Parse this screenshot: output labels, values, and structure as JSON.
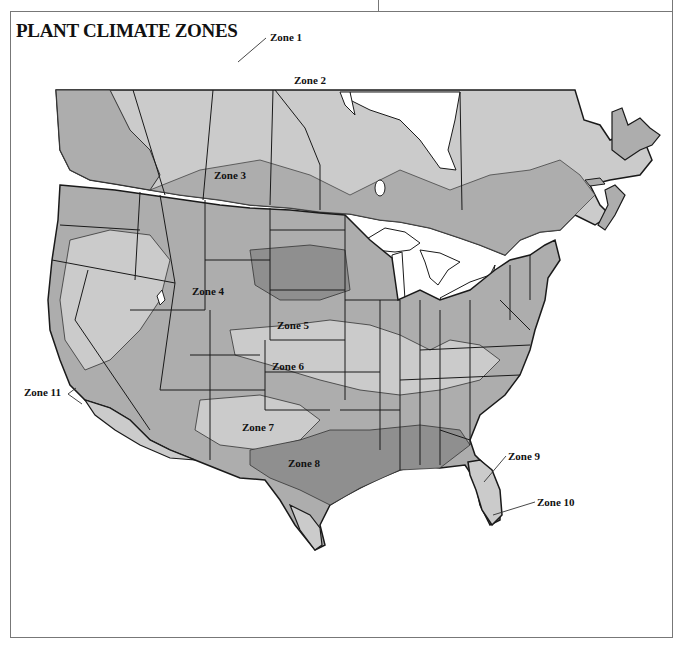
{
  "title": "PLANT CLIMATE ZONES",
  "colors": {
    "light": "#cbcbcb",
    "medium": "#adadad",
    "dark": "#8f8f8f",
    "water": "#ffffff",
    "border": "#1a1a1a"
  },
  "zones": [
    {
      "label": "Zone 1",
      "x": 270,
      "y": 41
    },
    {
      "label": "Zone 2",
      "x": 294,
      "y": 84
    },
    {
      "label": "Zone 3",
      "x": 214,
      "y": 179
    },
    {
      "label": "Zone 4",
      "x": 192,
      "y": 295
    },
    {
      "label": "Zone 5",
      "x": 277,
      "y": 329
    },
    {
      "label": "Zone 6",
      "x": 272,
      "y": 370
    },
    {
      "label": "Zone 7",
      "x": 242,
      "y": 431
    },
    {
      "label": "Zone 8",
      "x": 288,
      "y": 467
    },
    {
      "label": "Zone 9",
      "x": 508,
      "y": 460
    },
    {
      "label": "Zone 10",
      "x": 537,
      "y": 506
    },
    {
      "label": "Zone 11",
      "x": 24,
      "y": 396
    }
  ]
}
